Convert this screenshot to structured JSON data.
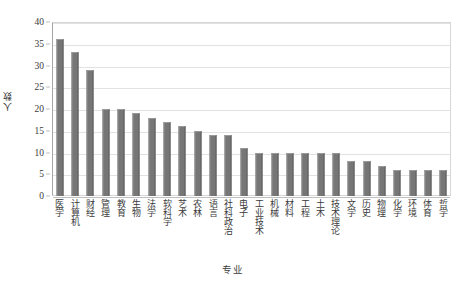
{
  "chart_data": {
    "type": "bar",
    "title": "",
    "xlabel": "专业",
    "ylabel": "人数",
    "ylim": [
      0,
      40
    ],
    "ytick_step": 5,
    "yticks": [
      0,
      5,
      10,
      15,
      20,
      25,
      30,
      35,
      40
    ],
    "grid": true,
    "legend": false,
    "bar_color": "#767676",
    "categories": [
      "医学",
      "计算机",
      "财经",
      "管理",
      "教育",
      "生物",
      "法学",
      "软科学",
      "艺术",
      "农林",
      "语言",
      "社科政治",
      "电子",
      "工业技术",
      "机械",
      "材料",
      "工程",
      "土木",
      "技术理论",
      "文学",
      "历史",
      "物理",
      "化学",
      "环境",
      "体育",
      "哲学"
    ],
    "values": [
      36,
      33,
      29,
      20,
      20,
      19,
      18,
      17,
      16,
      15,
      14,
      14,
      11,
      10,
      10,
      10,
      10,
      10,
      10,
      8,
      8,
      7,
      6,
      6,
      6,
      6
    ]
  }
}
